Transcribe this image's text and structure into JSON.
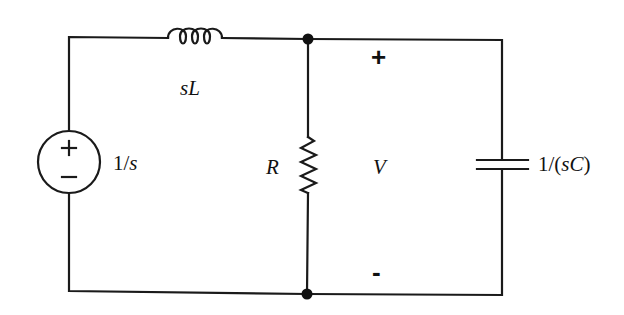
{
  "diagram": {
    "type": "circuit",
    "stroke_color": "#1a1a1a",
    "components": [
      {
        "id": "source",
        "kind": "voltage-source",
        "label": "1/s",
        "polarity_top": "+",
        "polarity_bottom": "−"
      },
      {
        "id": "inductor",
        "kind": "inductor",
        "label": "sL"
      },
      {
        "id": "resistor",
        "kind": "resistor",
        "label": "R"
      },
      {
        "id": "capacitor",
        "kind": "capacitor",
        "label": "1/(sC)"
      }
    ],
    "nodes": [
      {
        "id": "top-node",
        "kind": "junction-dot"
      },
      {
        "id": "bottom-node",
        "kind": "junction-dot"
      }
    ],
    "voltage": {
      "label": "V",
      "plus": "+",
      "minus": "-"
    }
  },
  "labels": {
    "source_value": "1/s",
    "inductor_value": "sL",
    "resistor_value": "R",
    "capacitor_value": "1/(sC)",
    "voltage_name": "V",
    "voltage_plus": "+",
    "voltage_minus": "-"
  }
}
